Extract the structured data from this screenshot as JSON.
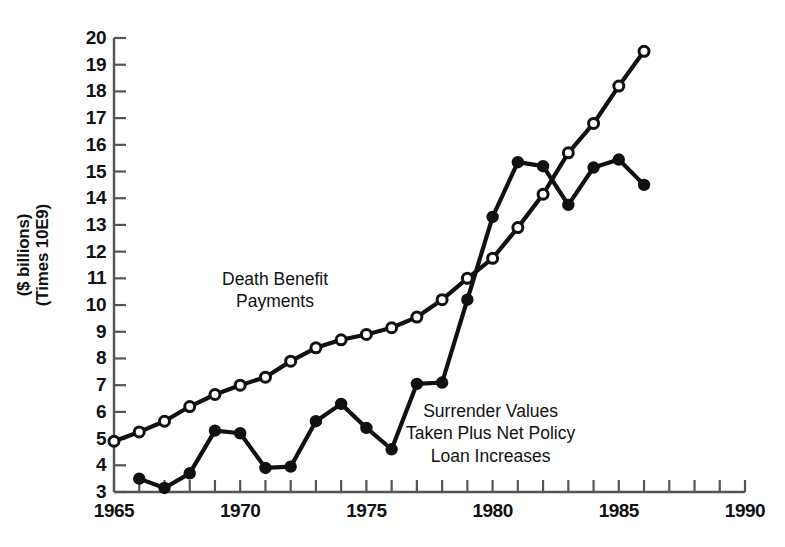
{
  "chart_data": {
    "type": "line",
    "title": "",
    "xlabel": "",
    "ylabel": "($ billions) (Times 10E9)",
    "ylabel_lines": [
      "($ billions)",
      "(Times 10E9)"
    ],
    "xlim": [
      1965,
      1990
    ],
    "ylim": [
      3,
      20
    ],
    "x_tick_labels": [
      "1965",
      "1970",
      "1975",
      "1980",
      "1985",
      "1990"
    ],
    "x_tick_values": [
      1965,
      1970,
      1975,
      1980,
      1985,
      1990
    ],
    "x_minor_tick_step": 1,
    "y_tick_labels": [
      "3",
      "4",
      "5",
      "6",
      "7",
      "8",
      "9",
      "10",
      "11",
      "12",
      "13",
      "14",
      "15",
      "16",
      "17",
      "18",
      "19",
      "20"
    ],
    "y_tick_values": [
      3,
      4,
      5,
      6,
      7,
      8,
      9,
      10,
      11,
      12,
      13,
      14,
      15,
      16,
      17,
      18,
      19,
      20
    ],
    "grid": false,
    "legend": "inline-annotations",
    "series": [
      {
        "name": "Death Benefit Payments",
        "marker": "open-circle",
        "annotation_lines": [
          "Death Benefit",
          "Payments"
        ],
        "x": [
          1965,
          1966,
          1967,
          1968,
          1969,
          1970,
          1971,
          1972,
          1973,
          1974,
          1975,
          1976,
          1977,
          1978,
          1979,
          1980,
          1981,
          1982,
          1983,
          1984,
          1985,
          1986
        ],
        "values": [
          4.9,
          5.25,
          5.65,
          6.2,
          6.65,
          7.0,
          7.3,
          7.9,
          8.4,
          8.7,
          8.9,
          9.15,
          9.55,
          10.2,
          11.0,
          11.75,
          12.9,
          14.15,
          15.7,
          16.8,
          18.2,
          19.5
        ]
      },
      {
        "name": "Surrender Values Taken Plus Net Policy Loan Increases",
        "marker": "filled-circle",
        "annotation_lines": [
          "Surrender Values",
          "Taken Plus Net Policy",
          "Loan Increases"
        ],
        "x": [
          1966,
          1967,
          1968,
          1969,
          1970,
          1971,
          1972,
          1973,
          1974,
          1975,
          1976,
          1977,
          1978,
          1979,
          1980,
          1981,
          1982,
          1983,
          1984,
          1985,
          1986
        ],
        "values": [
          3.5,
          3.15,
          3.7,
          5.3,
          5.2,
          3.9,
          3.95,
          5.65,
          6.3,
          5.4,
          4.6,
          7.05,
          7.1,
          10.2,
          13.3,
          15.35,
          15.2,
          13.75,
          15.15,
          15.45,
          14.5
        ]
      }
    ]
  },
  "axis": {
    "y_title_line1": "($ billions)",
    "y_title_line2": "(Times 10E9)"
  },
  "colors": {
    "line": "#111111",
    "marker_fill_open": "#ffffff",
    "marker_fill_closed": "#111111",
    "axis": "#555555",
    "background": "#ffffff"
  }
}
